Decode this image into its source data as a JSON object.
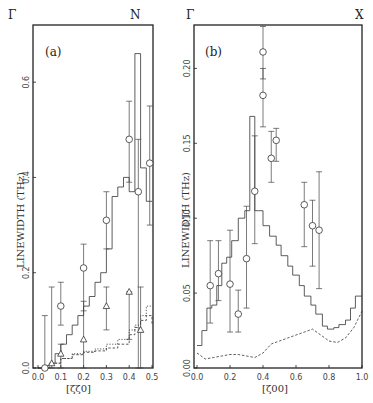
{
  "chart_data": [
    {
      "type": "line",
      "panel_label": "(a)",
      "corner_left": "Γ",
      "corner_right": "N",
      "xlabel": "[ζζ0]",
      "ylabel": "LINEWIDTH (THz)",
      "xlim": [
        0.0,
        0.5
      ],
      "ylim": [
        0.0,
        0.72
      ],
      "xticks": [
        "0.0",
        "0.1",
        "0.2",
        "0.3",
        "0.4",
        "0.5"
      ],
      "yticks": [
        "0.0",
        "0.2",
        "0.4",
        "0.6"
      ],
      "grid": false,
      "series": [
        {
          "name": "longitudinal calc (solid histogram)",
          "style": "solid-step",
          "x": [
            0.0,
            0.025,
            0.05,
            0.075,
            0.1,
            0.125,
            0.15,
            0.175,
            0.2,
            0.225,
            0.25,
            0.275,
            0.3,
            0.325,
            0.35,
            0.375,
            0.4,
            0.425,
            0.45,
            0.475,
            0.5
          ],
          "y": [
            0.0,
            0.005,
            0.01,
            0.03,
            0.05,
            0.07,
            0.09,
            0.11,
            0.13,
            0.15,
            0.18,
            0.2,
            0.25,
            0.36,
            0.38,
            0.4,
            0.37,
            0.66,
            0.42,
            0.35,
            0.35
          ]
        },
        {
          "name": "transverse calc T1 (dotted histogram)",
          "style": "dotted-step",
          "x": [
            0.0,
            0.05,
            0.1,
            0.15,
            0.2,
            0.25,
            0.3,
            0.35,
            0.4,
            0.425,
            0.45,
            0.475,
            0.5
          ],
          "y": [
            0.0,
            0.01,
            0.02,
            0.03,
            0.035,
            0.04,
            0.05,
            0.06,
            0.08,
            0.09,
            0.11,
            0.13,
            0.13
          ]
        },
        {
          "name": "transverse calc T2 (dashed histogram)",
          "style": "dashed-step",
          "x": [
            0.0,
            0.05,
            0.1,
            0.15,
            0.2,
            0.25,
            0.3,
            0.35,
            0.4,
            0.425,
            0.45,
            0.475,
            0.5
          ],
          "y": [
            0.0,
            0.01,
            0.02,
            0.028,
            0.033,
            0.036,
            0.042,
            0.05,
            0.07,
            0.085,
            0.1,
            0.11,
            0.09
          ]
        },
        {
          "name": "longitudinal exp (circles)",
          "style": "circle-errorbar",
          "x": [
            0.03,
            0.1,
            0.2,
            0.3,
            0.4,
            0.44,
            0.49
          ],
          "y": [
            0.0,
            0.13,
            0.21,
            0.31,
            0.48,
            0.37,
            0.43
          ],
          "err_low": [
            0.0,
            0.09,
            0.12,
            0.25,
            0.39,
            0.0,
            0.3
          ],
          "err_high": [
            0.11,
            0.18,
            0.26,
            0.37,
            0.56,
            0.48,
            0.55
          ]
        },
        {
          "name": "transverse exp (triangles)",
          "style": "triangle-errorbar",
          "x": [
            0.06,
            0.1,
            0.2,
            0.3,
            0.4,
            0.45
          ],
          "y": [
            0.01,
            0.03,
            0.06,
            0.13,
            0.16,
            0.08
          ],
          "err_low": [
            0.0,
            0.0,
            0.0,
            0.08,
            0.06,
            0.0
          ],
          "err_high": [
            0.17,
            0.05,
            0.14,
            0.17,
            0.16,
            0.17
          ]
        }
      ]
    },
    {
      "type": "line",
      "panel_label": "(b)",
      "corner_left": "Γ",
      "corner_right": "X",
      "xlabel": "[ζ00]",
      "ylabel": "LINEWIDTH (THz)",
      "xlim": [
        0.0,
        1.0
      ],
      "ylim": [
        0.0,
        0.229
      ],
      "xticks": [
        "0.0",
        "0.2",
        "0.4",
        "0.6",
        "0.8",
        "1.0"
      ],
      "yticks": [
        "0.00",
        "0.05",
        "0.10",
        "0.15",
        "0.20"
      ],
      "grid": false,
      "series": [
        {
          "name": "longitudinal calc (solid histogram)",
          "style": "solid-step",
          "x": [
            0.0,
            0.025,
            0.075,
            0.125,
            0.175,
            0.225,
            0.275,
            0.325,
            0.375,
            0.425,
            0.475,
            0.525,
            0.575,
            0.625,
            0.675,
            0.725,
            0.775,
            0.825,
            0.875,
            0.925,
            0.975,
            1.0
          ],
          "y": [
            0.015,
            0.025,
            0.04,
            0.055,
            0.07,
            0.085,
            0.105,
            0.168,
            0.105,
            0.09,
            0.078,
            0.065,
            0.055,
            0.045,
            0.035,
            0.027,
            0.024,
            0.026,
            0.03,
            0.04,
            0.048,
            0.048
          ],
          "step_x": [
            0.0,
            0.03,
            0.06,
            0.09,
            0.12,
            0.15,
            0.18,
            0.21,
            0.25,
            0.29,
            0.32,
            0.35,
            0.37,
            0.4,
            0.44,
            0.48,
            0.51,
            0.55,
            0.58,
            0.62,
            0.65,
            0.69,
            0.72,
            0.76,
            0.79,
            0.83,
            0.86,
            0.9,
            0.93,
            0.96,
            1.0
          ],
          "step_y": [
            0.015,
            0.025,
            0.04,
            0.042,
            0.055,
            0.07,
            0.074,
            0.085,
            0.1,
            0.105,
            0.168,
            0.105,
            0.105,
            0.095,
            0.088,
            0.082,
            0.075,
            0.068,
            0.062,
            0.055,
            0.048,
            0.042,
            0.036,
            0.028,
            0.026,
            0.027,
            0.029,
            0.032,
            0.04,
            0.048,
            0.048
          ]
        },
        {
          "name": "transverse calc (dashed)",
          "style": "dashed",
          "x": [
            0.0,
            0.05,
            0.1,
            0.15,
            0.2,
            0.25,
            0.3,
            0.35,
            0.4,
            0.45,
            0.5,
            0.55,
            0.6,
            0.65,
            0.7,
            0.75,
            0.8,
            0.85,
            0.9,
            0.95,
            1.0
          ],
          "y": [
            0.01,
            0.006,
            0.007,
            0.008,
            0.009,
            0.009,
            0.008,
            0.007,
            0.01,
            0.016,
            0.018,
            0.02,
            0.022,
            0.024,
            0.026,
            0.022,
            0.018,
            0.017,
            0.02,
            0.027,
            0.038
          ]
        },
        {
          "name": "longitudinal exp (circles)",
          "style": "circle-errorbar",
          "x": [
            0.08,
            0.13,
            0.2,
            0.25,
            0.3,
            0.35,
            0.4,
            0.4,
            0.45,
            0.48,
            0.65,
            0.7,
            0.74
          ],
          "y": [
            0.055,
            0.063,
            0.056,
            0.036,
            0.073,
            0.118,
            0.211,
            0.182,
            0.14,
            0.152,
            0.109,
            0.095,
            0.092
          ],
          "err_low": [
            0.03,
            0.045,
            0.024,
            0.024,
            0.04,
            0.083,
            0.193,
            0.161,
            0.124,
            0.138,
            0.081,
            0.068,
            0.053
          ],
          "err_high": [
            0.085,
            0.085,
            0.092,
            0.052,
            0.108,
            0.155,
            0.228,
            0.2,
            0.158,
            0.16,
            0.124,
            0.112,
            0.131
          ]
        }
      ]
    }
  ]
}
